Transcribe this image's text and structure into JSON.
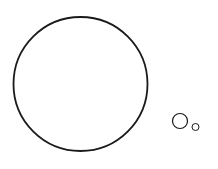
{
  "diagram": {
    "background": "#ffffff",
    "stroke_color": "#1a1a1a",
    "shapes": [
      {
        "type": "circle",
        "name": "large-circle",
        "cx": 80.5,
        "cy": 84,
        "r": 67,
        "stroke_width": 1.8
      },
      {
        "type": "circle",
        "name": "medium-circle",
        "cx": 180,
        "cy": 121,
        "r": 7.5,
        "stroke_width": 1.2
      },
      {
        "type": "circle",
        "name": "small-circle",
        "cx": 195.5,
        "cy": 127,
        "r": 3.5,
        "stroke_width": 1.0
      }
    ]
  }
}
